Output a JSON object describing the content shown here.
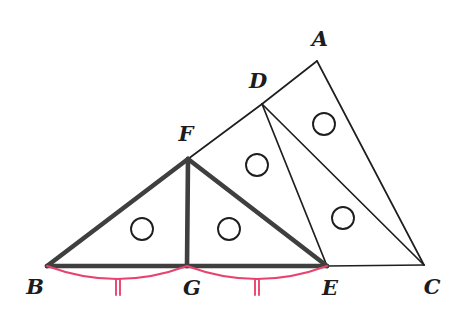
{
  "figure": {
    "background_color": "#ffffff",
    "width": 464,
    "height": 334,
    "colors": {
      "bold_stroke": "#3f3f3f",
      "thin_stroke": "#1e1e1e",
      "congruence_mark": "#e8436f",
      "label_text": "#1c1c1c"
    }
  },
  "points": {
    "A": {
      "label": "A",
      "x": 317,
      "y": 61,
      "label_x": 320,
      "label_y": 40
    },
    "B": {
      "label": "B",
      "x": 47,
      "y": 266,
      "label_x": 35,
      "label_y": 288
    },
    "C": {
      "label": "C",
      "x": 424,
      "y": 265,
      "label_x": 432,
      "label_y": 288
    },
    "D": {
      "label": "D",
      "x": 262,
      "y": 104,
      "label_x": 258,
      "label_y": 82
    },
    "E": {
      "label": "E",
      "x": 327,
      "y": 266,
      "label_x": 330,
      "label_y": 289
    },
    "F": {
      "label": "F",
      "x": 188,
      "y": 159,
      "label_x": 186,
      "label_y": 135
    },
    "G": {
      "label": "G",
      "x": 187,
      "y": 266,
      "label_x": 192,
      "label_y": 289
    }
  },
  "segments": [
    {
      "name": "segment-BF",
      "from": "B",
      "to": "F",
      "weight": "bold"
    },
    {
      "name": "segment-FE",
      "from": "F",
      "to": "E",
      "weight": "bold"
    },
    {
      "name": "segment-FG",
      "from": "F",
      "to": "G",
      "weight": "bold"
    },
    {
      "name": "segment-BG",
      "from": "B",
      "to": "G",
      "weight": "bold"
    },
    {
      "name": "segment-GE",
      "from": "G",
      "to": "E",
      "weight": "bold"
    },
    {
      "name": "segment-FD",
      "from": "F",
      "to": "D",
      "weight": "thin"
    },
    {
      "name": "segment-DA",
      "from": "D",
      "to": "A",
      "weight": "thin"
    },
    {
      "name": "segment-DE",
      "from": "D",
      "to": "E",
      "weight": "thin"
    },
    {
      "name": "segment-DC",
      "from": "D",
      "to": "C",
      "weight": "thin"
    },
    {
      "name": "segment-AC",
      "from": "A",
      "to": "C",
      "weight": "thin"
    },
    {
      "name": "segment-EC",
      "from": "E",
      "to": "C",
      "weight": "thin"
    }
  ],
  "angle_markers": [
    {
      "name": "angle-marker-BFG",
      "x": 142,
      "y": 229,
      "r": 11
    },
    {
      "name": "angle-marker-GFE",
      "x": 229,
      "y": 229,
      "r": 11
    },
    {
      "name": "angle-marker-FDE",
      "x": 257,
      "y": 165,
      "r": 11
    },
    {
      "name": "angle-marker-DEC",
      "x": 343,
      "y": 218,
      "r": 11
    },
    {
      "name": "angle-marker-DAC",
      "x": 324,
      "y": 124,
      "r": 11
    }
  ],
  "congruence_arcs": [
    {
      "name": "congruence-arc-BG",
      "from": "B",
      "to": "G",
      "sag": 13,
      "tick_count": 2,
      "tick_x": 118,
      "tick_y": 287,
      "tick_half_height": 8,
      "tick_gap": 4
    },
    {
      "name": "congruence-arc-GE",
      "from": "G",
      "to": "E",
      "sag": 13,
      "tick_count": 2,
      "tick_x": 257,
      "tick_y": 287,
      "tick_half_height": 8,
      "tick_gap": 4
    }
  ]
}
